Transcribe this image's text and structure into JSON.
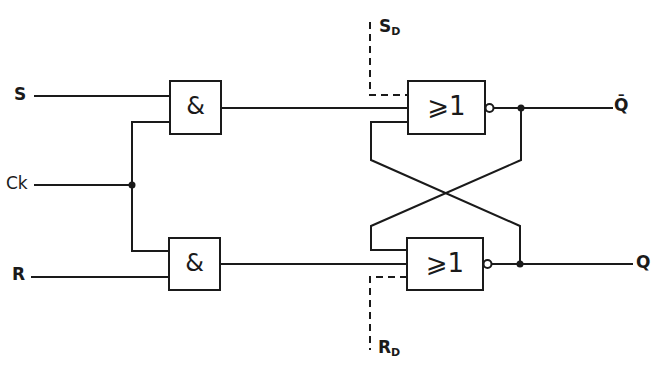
{
  "diagram": {
    "inputs": {
      "s_label": "S",
      "ck_label": "Ck",
      "r_label": "R",
      "sd_label": "S",
      "sd_sub": "D",
      "rd_label": "R",
      "rd_sub": "D"
    },
    "outputs": {
      "qbar_label": "Q̄",
      "q_label": "Q"
    },
    "gates": [
      {
        "id": "and-top",
        "symbol": "&",
        "type": "AND"
      },
      {
        "id": "and-bottom",
        "symbol": "&",
        "type": "AND"
      },
      {
        "id": "nor-top",
        "symbol": "⩾1",
        "type": "NOR"
      },
      {
        "id": "nor-bottom",
        "symbol": "⩾1",
        "type": "NOR"
      }
    ],
    "colors": {
      "line": "#1a1a1a",
      "background": "#ffffff"
    }
  }
}
